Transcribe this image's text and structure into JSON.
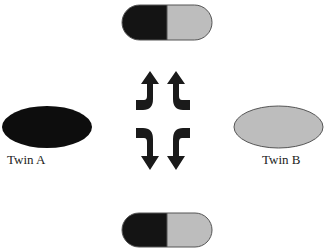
{
  "diagram": {
    "twin_a": {
      "label": "Twin A",
      "color": "#0d0d0d"
    },
    "twin_b": {
      "label": "Twin B",
      "color": "#bdbdbd"
    },
    "capsule_top": {
      "left_color": "#141414",
      "right_color": "#bdbdbd"
    },
    "capsule_bottom": {
      "left_color": "#141414",
      "right_color": "#bdbdbd"
    },
    "arrows": [
      {
        "name": "left-up-arrow",
        "direction": "up"
      },
      {
        "name": "right-up-arrow",
        "direction": "up"
      },
      {
        "name": "left-down-arrow",
        "direction": "down"
      },
      {
        "name": "right-down-arrow",
        "direction": "down"
      }
    ],
    "stroke_color": "#555555"
  }
}
